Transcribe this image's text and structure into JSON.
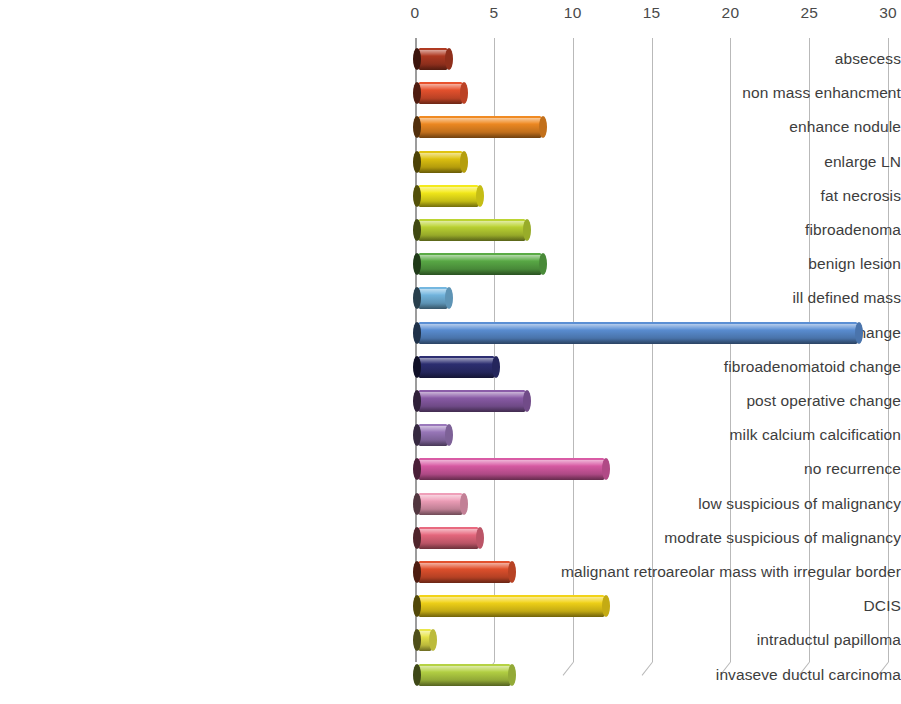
{
  "chart_data": {
    "type": "bar",
    "orientation": "horizontal",
    "title": "",
    "subtitle": "",
    "xlabel": "",
    "ylabel": "",
    "xlim": [
      0,
      30
    ],
    "xticks": [
      0,
      5,
      10,
      15,
      20,
      25,
      30
    ],
    "grid": true,
    "legend": false,
    "legend_position": "none",
    "style": "3d-cylinder",
    "categories": [
      "absecess",
      "non mass enhancment",
      "enhance nodule",
      "enlarge LN",
      "fat necrosis",
      "fibroadenoma",
      "benign lesion",
      "ill defined mass",
      "fibrocystic change",
      "fibroadenomatoid change",
      "post operative change",
      "milk calcium calcification",
      "no recurrence",
      "low suspicious of malignancy",
      "modrate suspicious of malignancy",
      "malignant retroareolar mass with irregular border",
      "DCIS",
      "intraductul papilloma",
      "invaseve ductul carcinoma"
    ],
    "values": [
      2,
      3,
      8,
      3,
      4,
      7,
      8,
      2,
      28,
      5,
      7,
      2,
      12,
      3,
      4,
      6,
      12,
      1,
      6
    ],
    "colors": [
      "#b03a22",
      "#e8522e",
      "#f08a22",
      "#e0c310",
      "#f4ea1a",
      "#bcd433",
      "#5aab46",
      "#74b7e0",
      "#5b8fd4",
      "#2d2f72",
      "#8b5ca8",
      "#9a78bb",
      "#d95ba5",
      "#ef9fb9",
      "#e8697f",
      "#e2512d",
      "#f2d318",
      "#e9e64a",
      "#b5d244"
    ]
  }
}
